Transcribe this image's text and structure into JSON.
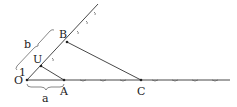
{
  "diagram": {
    "type": "geometric-construction",
    "points": [
      {
        "id": "O",
        "label": "O",
        "x": 27,
        "y": 80
      },
      {
        "id": "A",
        "label": "A",
        "x": 64,
        "y": 80
      },
      {
        "id": "U",
        "label": "U",
        "x": 41,
        "y": 66
      },
      {
        "id": "B",
        "label": "B",
        "x": 67,
        "y": 42
      },
      {
        "id": "C",
        "label": "C",
        "x": 141,
        "y": 80
      }
    ],
    "segment_labels": {
      "unit": "1",
      "a": "a",
      "b": "b"
    },
    "colors": {
      "line": "#333333",
      "text": "#222222",
      "background": "#ffffff"
    }
  }
}
